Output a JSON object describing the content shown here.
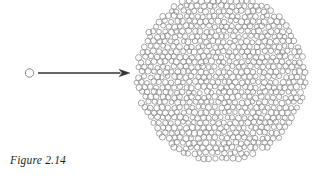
{
  "figure": {
    "caption": "Figure 2.14",
    "canvas": {
      "width": 317,
      "height": 186
    },
    "colors": {
      "background": "#ffffff",
      "circle_stroke": "#8a8a8a",
      "arrow": "#333333",
      "caption_text": "#231f20"
    },
    "small_circle": {
      "label": "single-cell",
      "cx": 29.5,
      "cy": 73,
      "r": 4.2,
      "stroke_width": 1.0
    },
    "arrow": {
      "label": "growth-arrow",
      "x1": 38,
      "y1": 73,
      "x2": 130,
      "y2": 73,
      "shaft_width": 1.3,
      "head_length": 11,
      "head_width": 7.5
    },
    "cluster": {
      "label": "cell-colony",
      "cx": 221,
      "cy": 77,
      "r": 86,
      "cell_radius": 2.75,
      "cell_spacing": 5.85,
      "cell_stroke_width": 0.75,
      "jitter": 0.95,
      "approx_cell_count": 640
    }
  }
}
